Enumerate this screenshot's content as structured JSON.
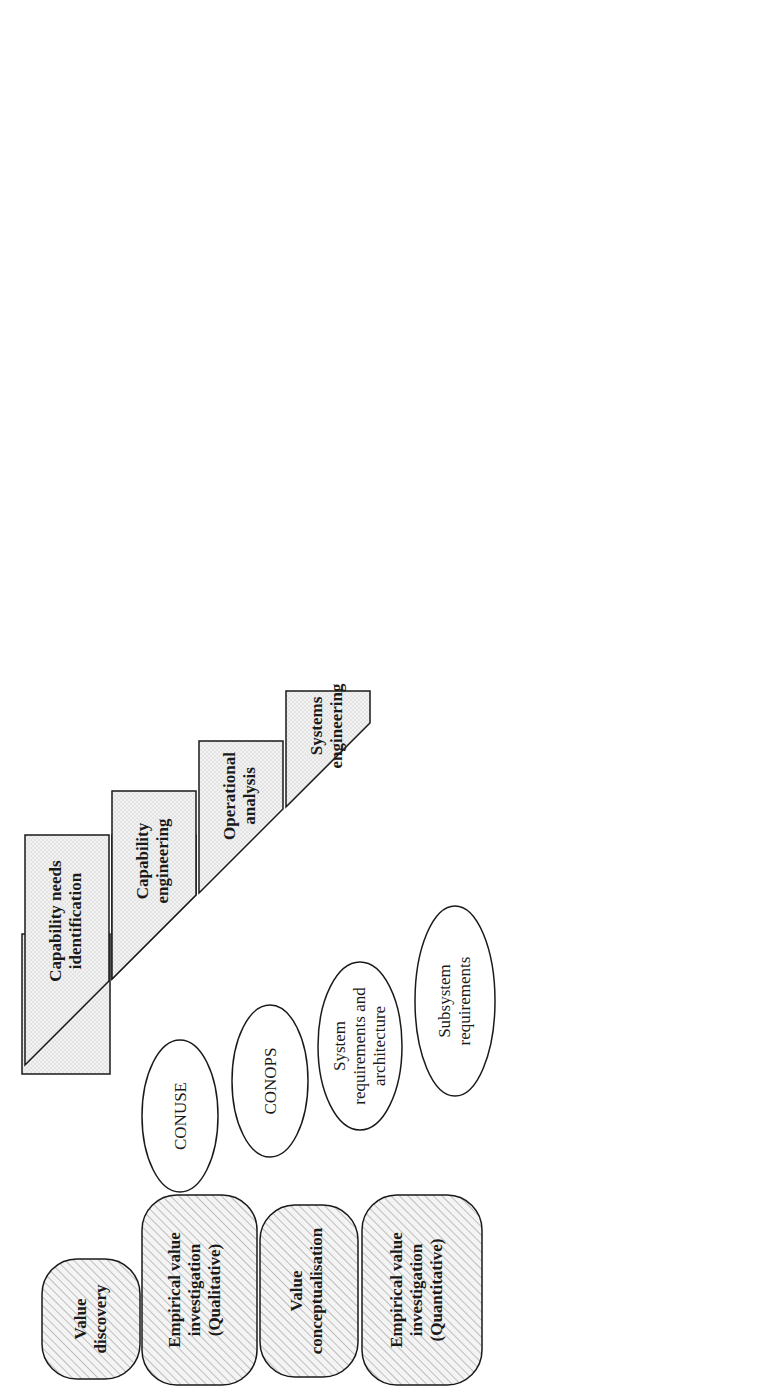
{
  "colors": {
    "stroke": "#1a1a1a",
    "process_fill": "#eeeeee",
    "test_fill": "#d6d6d6",
    "value_fill": "#f2f2f2",
    "hatch": "#9a9a9a"
  },
  "value_processes_left": [
    {
      "lines": [
        "Value",
        "discovery"
      ]
    },
    {
      "lines": [
        "Empirical value",
        "investigation",
        "(Qualitative)"
      ]
    },
    {
      "lines": [
        "Value",
        "conceptualisation"
      ]
    },
    {
      "lines": [
        "Empirical value",
        "investigation",
        "(Quantitative)"
      ]
    }
  ],
  "value_processes_right": [
    {
      "lines": [
        "Empirical value",
        "investigation",
        "(Qualitative and",
        "quantitative)"
      ]
    },
    {
      "lines": [
        "Empirical value",
        "investigation",
        "(Qualitative)"
      ]
    },
    {
      "lines": [
        "Technical value",
        "investigation"
      ]
    }
  ],
  "left_processes": [
    {
      "lines": [
        "Capability needs",
        "identification"
      ]
    },
    {
      "lines": [
        "Capability",
        "engineering"
      ]
    },
    {
      "lines": [
        "Operational",
        "analysis"
      ]
    },
    {
      "lines": [
        "Systems",
        "engineering"
      ]
    }
  ],
  "bottom_process": {
    "lines": [
      "Product designs",
      "Concept assessment development",
      "Manufacture"
    ]
  },
  "right_processes": [
    {
      "lines": [
        "Incremental",
        "upgrades"
      ]
    },
    {
      "lines": [
        "Refine",
        "CONOPS"
      ]
    },
    {
      "lines": [
        "Setting",
        "to",
        "work"
      ]
    },
    {
      "lines": [
        "Incremental",
        "integration"
      ]
    }
  ],
  "test_philosophy": [
    {
      "lines": [
        "Exercises and",
        "operations"
      ]
    },
    {
      "lines": [
        "Stretching",
        "scenarios"
      ]
    },
    {
      "lines": [
        "Simulation",
        "and trials"
      ]
    },
    {
      "lines": [
        "Supplier-led",
        "trials"
      ]
    }
  ],
  "left_deliverables": [
    {
      "lines": [
        "CONUSE"
      ]
    },
    {
      "lines": [
        "CONOPS"
      ]
    },
    {
      "lines": [
        "System",
        "requirements and",
        "architecture"
      ]
    },
    {
      "lines": [
        "Subsystem",
        "requirements"
      ]
    }
  ],
  "right_deliverables": [
    {
      "lines": [
        "Capability"
      ]
    },
    {
      "lines": [
        "Verified",
        "system design"
      ]
    },
    {
      "lines": [
        "Validated",
        "system design"
      ]
    },
    {
      "lines": [
        "Tested",
        "subsystems"
      ]
    }
  ],
  "time_arrow": {
    "label": "Time"
  },
  "key": {
    "title": "Key",
    "deliverables": {
      "lines": [
        "Deliverables"
      ]
    },
    "test_philosophy": {
      "lines": [
        "Test",
        "philosophy"
      ]
    },
    "process": {
      "lines": [
        "Process"
      ]
    },
    "value_process": {
      "lines": [
        "Value-based design",
        "process"
      ]
    },
    "footnote": "Concept of Operations (CONOPS), Concepts of Use (CONUSE)"
  }
}
